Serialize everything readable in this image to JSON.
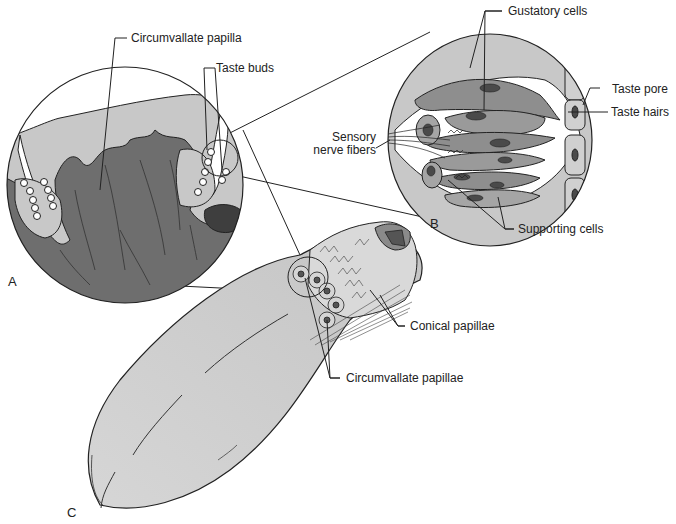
{
  "diagram": {
    "panels": {
      "a": "A",
      "b": "B",
      "c": "C"
    },
    "labels": {
      "circumvallate_papilla": "Circumvallate papilla",
      "taste_buds": "Taste buds",
      "gustatory_cells": "Gustatory cells",
      "taste_pore": "Taste pore",
      "taste_hairs": "Taste hairs",
      "sensory_nerve_fibers_1": "Sensory",
      "sensory_nerve_fibers_2": "nerve fibers",
      "supporting_cells": "Supporting cells",
      "conical_papillae": "Conical papillae",
      "circumvallate_papillae": "Circumvallate papillae"
    },
    "colors": {
      "dark_tissue": "#6e6e6e",
      "mid_tissue": "#9a9a9a",
      "light_tissue": "#c8c8c8",
      "tongue": "#cfcfcf",
      "outline": "#222222",
      "nucleus": "#4a4a4a"
    }
  }
}
